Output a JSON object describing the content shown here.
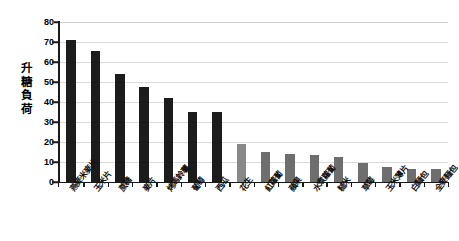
{
  "chart_data": {
    "type": "bar",
    "title": "",
    "subtitle": "",
    "xlabel": "",
    "ylabel": "升糖負荷",
    "ylim": [
      0,
      80
    ],
    "yticks": [
      0,
      10,
      20,
      30,
      40,
      50,
      60,
      70,
      80
    ],
    "grid": true,
    "legend": "none",
    "categories": [
      "燕麥米麥片",
      "玉米片",
      "蔗糖",
      "麥片",
      "烤馬鈴薯",
      "葡萄",
      "西瓜",
      "花生",
      "紅蘿蔔",
      "蘋果",
      "水煮蘿蔔",
      "糙米",
      "草莓",
      "玉米薄片",
      "白麵包",
      "全麥麵包"
    ],
    "values": [
      71,
      65.5,
      54,
      47.5,
      42,
      35,
      35,
      19,
      15,
      14,
      13.5,
      12.5,
      9.5,
      7.5,
      6.5,
      6.5
    ],
    "series_name": "升糖負荷",
    "bar_colors": [
      "#1c1c1c",
      "#1c1c1c",
      "#1c1c1c",
      "#1c1c1c",
      "#1c1c1c",
      "#1c1c1c",
      "#1c1c1c",
      "#888888",
      "#6e6e6e",
      "#6e6e6e",
      "#6e6e6e",
      "#6e6e6e",
      "#6e6e6e",
      "#6e6e6e",
      "#6e6e6e",
      "#6e6e6e"
    ],
    "axis_color": "#1a1a1a",
    "gridline_color": "#d9d9d9",
    "background_color": "#ffffff"
  }
}
